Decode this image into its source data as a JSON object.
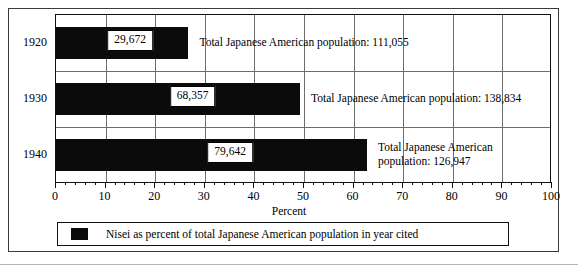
{
  "chart_data": {
    "type": "bar",
    "orientation": "horizontal",
    "title": "",
    "xlabel": "Percent",
    "ylabel": "",
    "xlim": [
      0,
      100
    ],
    "xticks": [
      0,
      10,
      20,
      30,
      40,
      50,
      60,
      70,
      80,
      90,
      100
    ],
    "xtick_labels": [
      "0",
      "10",
      "20",
      "30",
      "40",
      "50",
      "60",
      "70",
      "80",
      "90",
      "100"
    ],
    "grid": true,
    "categories": [
      "1920",
      "1930",
      "1940"
    ],
    "series": [
      {
        "name": "Nisei as percent of total Japanese American population in year cited",
        "values": [
          26.7,
          49.2,
          62.7
        ],
        "color": "#0b0b0b"
      }
    ],
    "bar_value_labels": [
      "29,672",
      "68,357",
      "79,642"
    ],
    "annotations": [
      "Total Japanese American population: 111,055",
      "Total Japanese American population: 138,834",
      "Total Japanese American population: 126,947"
    ],
    "legend": {
      "position": "bottom",
      "entries": [
        "Nisei as percent of total Japanese American population in year cited"
      ]
    }
  },
  "rows": [
    {
      "year": "1920",
      "percent": 26.7,
      "value_label": "29,672",
      "annotation": "Total Japanese American population: 111,055",
      "annotation_line1": "Total Japanese American population: 111,055",
      "annotation_line2": ""
    },
    {
      "year": "1930",
      "percent": 49.2,
      "value_label": "68,357",
      "annotation": "Total Japanese American population: 138,834",
      "annotation_line1": "Total Japanese American population: 138,834",
      "annotation_line2": ""
    },
    {
      "year": "1940",
      "percent": 62.7,
      "value_label": "79,642",
      "annotation": "Total Japanese American population: 126,947",
      "annotation_line1": "Total Japanese American",
      "annotation_line2": "population: 126,947"
    }
  ],
  "axis": {
    "title": "Percent",
    "ticks": [
      "0",
      "10",
      "20",
      "30",
      "40",
      "50",
      "60",
      "70",
      "80",
      "90",
      "100"
    ]
  },
  "legend": {
    "label": "Nisei as percent of total Japanese American population in year cited"
  }
}
